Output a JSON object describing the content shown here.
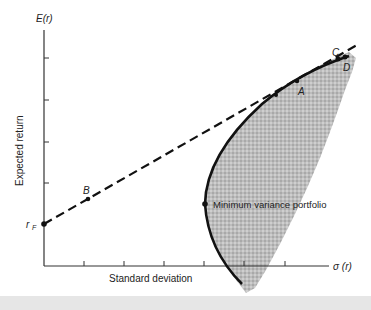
{
  "diagram": {
    "y_axis": {
      "label": "E(r)",
      "side_label": "Expected return"
    },
    "x_axis": {
      "label": "σ (r)",
      "side_label": "Standard deviation"
    },
    "points": {
      "rf": "r",
      "rf_sub": "F",
      "A": "A",
      "B": "B",
      "C": "C",
      "D": "D",
      "min_var": "Minimum variance portfolio"
    },
    "colors": {
      "shaded_region": "#b8b8b8",
      "frontier": "#111111",
      "tangent_line": "#111111",
      "axis": "#333333"
    }
  }
}
